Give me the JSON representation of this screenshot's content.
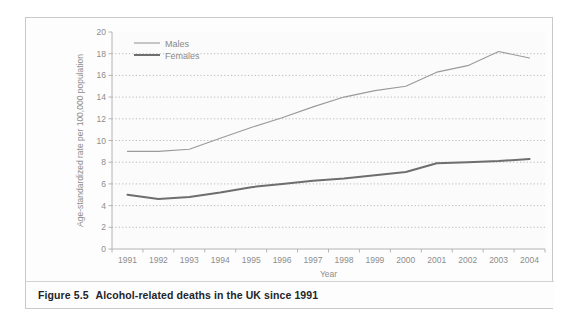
{
  "figure": {
    "caption_label": "Figure 5.5",
    "caption_text": "Alcohol-related deaths in the UK since 1991"
  },
  "colors": {
    "males_line": "#9a9a9a",
    "females_line": "#6e6e6e",
    "axis": "#b4b4b4",
    "gridline": "#9f9f9f",
    "tick_text": "#8d8d8d",
    "plot_background": "#fbfbfb",
    "figure_border": "#c9c9c9",
    "caption_color": "#23252a"
  },
  "chart_data": {
    "type": "line",
    "title": "",
    "xlabel": "Year",
    "ylabel": "Age-standardized rate per 100,000 population",
    "x": [
      1991,
      1992,
      1993,
      1994,
      1995,
      1996,
      1997,
      1998,
      1999,
      2000,
      2001,
      2002,
      2003,
      2004
    ],
    "categories": [
      "1991",
      "1992",
      "1993",
      "1994",
      "1995",
      "1996",
      "1997",
      "1998",
      "1999",
      "2000",
      "2001",
      "2002",
      "2003",
      "2004"
    ],
    "xlim": [
      1991,
      2004
    ],
    "ylim": [
      0,
      20
    ],
    "yticks": [
      0,
      2,
      4,
      6,
      8,
      10,
      12,
      14,
      16,
      18,
      20
    ],
    "ytick_labels": [
      "0",
      "2",
      "4",
      "6",
      "8",
      "10",
      "12",
      "14",
      "16",
      "18",
      "20"
    ],
    "grid": true,
    "grid_style": "dotted-horizontal",
    "legend_position": "top-left",
    "series": [
      {
        "name": "Males",
        "color": "#9a9a9a",
        "line_width": 1.1,
        "values": [
          9.0,
          9.0,
          9.2,
          10.2,
          11.2,
          12.1,
          13.1,
          14.0,
          14.6,
          15.0,
          16.3,
          16.9,
          18.2,
          17.6
        ]
      },
      {
        "name": "Females",
        "color": "#6e6e6e",
        "line_width": 2.0,
        "values": [
          5.0,
          4.6,
          4.8,
          5.2,
          5.7,
          6.0,
          6.3,
          6.5,
          6.8,
          7.1,
          7.9,
          8.0,
          8.1,
          8.3
        ]
      }
    ]
  }
}
